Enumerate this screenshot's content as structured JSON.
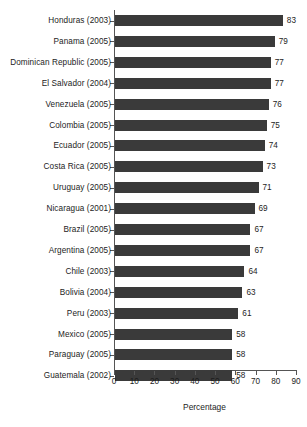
{
  "chart_data": {
    "type": "bar",
    "orientation": "horizontal",
    "title": "",
    "xlabel": "Percentage",
    "ylabel": "",
    "xlim": [
      0,
      90
    ],
    "xticks": [
      0,
      10,
      20,
      30,
      40,
      50,
      60,
      70,
      80,
      90
    ],
    "grid": false,
    "legend": null,
    "bar_color": "#3a3a3a",
    "categories": [
      "Honduras (2003)",
      "Panama (2005)",
      "Dominican Republic (2005)",
      "El Salvador (2004)",
      "Venezuela (2005)",
      "Colombia (2005)",
      "Ecuador (2005)",
      "Costa Rica (2005)",
      "Uruguay (2005)",
      "Nicaragua (2001)",
      "Brazil (2005)",
      "Argentina (2005)",
      "Chile (2003)",
      "Bolivia (2004)",
      "Peru (2003)",
      "Mexico (2005)",
      "Paraguay (2005)",
      "Guatemala (2002)"
    ],
    "values": [
      83,
      79,
      77,
      77,
      76,
      75,
      74,
      73,
      71,
      69,
      67,
      67,
      64,
      63,
      61,
      58,
      58,
      58
    ],
    "value_labels": [
      "83",
      "79",
      "77",
      "77",
      "76",
      "75",
      "74",
      "73",
      "71",
      "69",
      "67",
      "67",
      "64",
      "63",
      "61",
      "58",
      "58",
      "58"
    ],
    "xtick_labels": [
      "0",
      "10",
      "20",
      "30",
      "40",
      "50",
      "60",
      "70",
      "80",
      "90"
    ]
  }
}
